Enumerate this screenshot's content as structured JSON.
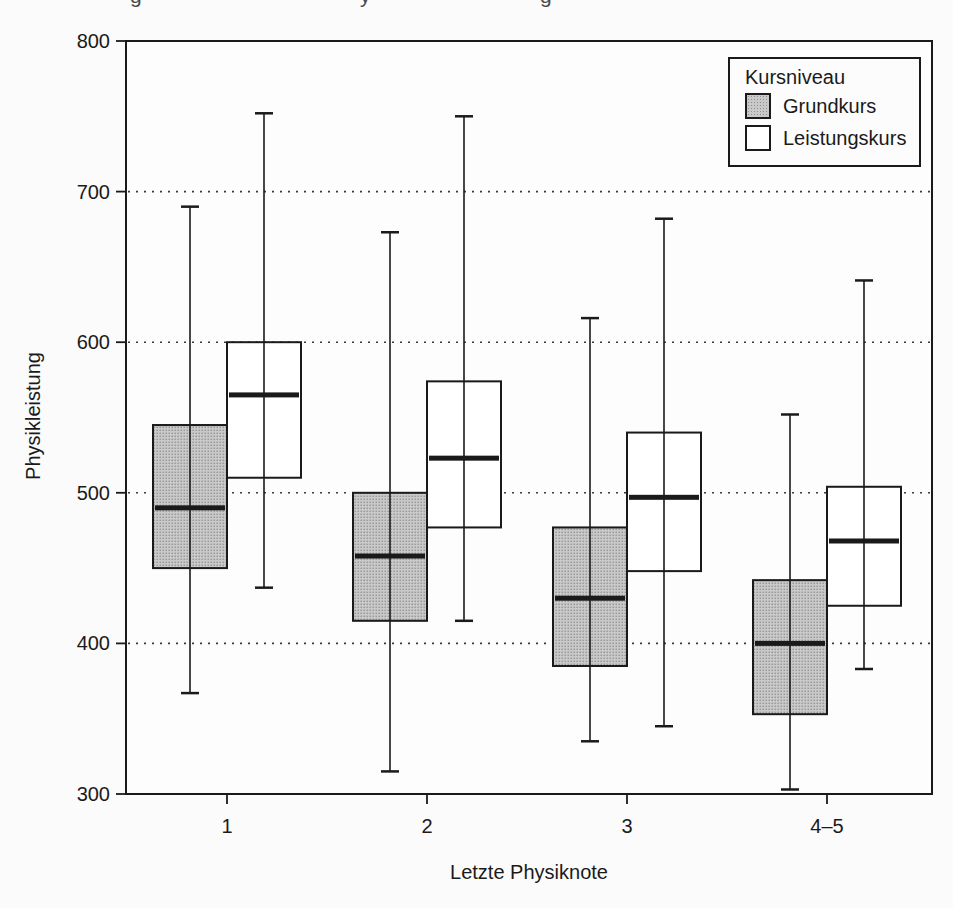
{
  "page": {
    "cropped_caption_fragments": [
      "g",
      "y",
      "g"
    ]
  },
  "chart_data": {
    "type": "boxplot",
    "title": "",
    "xlabel": "Letzte Physiknote",
    "ylabel": "Physikleistung",
    "ylim": [
      300,
      800
    ],
    "yticks": [
      300,
      400,
      500,
      600,
      700,
      800
    ],
    "gridlines": [
      400,
      500,
      600,
      700
    ],
    "grid_style": "dotted",
    "categories": [
      "1",
      "2",
      "3",
      "4–5"
    ],
    "legend": {
      "title": "Kursniveau",
      "position": "top-right",
      "entries": [
        {
          "label": "Grundkurs",
          "fill": "stippled-gray"
        },
        {
          "label": "Leistungskurs",
          "fill": "white"
        }
      ]
    },
    "series": [
      {
        "name": "Grundkurs",
        "style": "stippled-gray",
        "boxes": [
          {
            "category": "1",
            "whisker_low": 367,
            "q1": 450,
            "median": 490,
            "q3": 545,
            "whisker_high": 690
          },
          {
            "category": "2",
            "whisker_low": 315,
            "q1": 415,
            "median": 458,
            "q3": 500,
            "whisker_high": 673
          },
          {
            "category": "3",
            "whisker_low": 335,
            "q1": 385,
            "median": 430,
            "q3": 477,
            "whisker_high": 616
          },
          {
            "category": "4–5",
            "whisker_low": 303,
            "q1": 353,
            "median": 400,
            "q3": 442,
            "whisker_high": 552
          }
        ]
      },
      {
        "name": "Leistungskurs",
        "style": "white",
        "boxes": [
          {
            "category": "1",
            "whisker_low": 437,
            "q1": 510,
            "median": 565,
            "q3": 600,
            "whisker_high": 752
          },
          {
            "category": "2",
            "whisker_low": 415,
            "q1": 477,
            "median": 523,
            "q3": 574,
            "whisker_high": 750
          },
          {
            "category": "3",
            "whisker_low": 345,
            "q1": 448,
            "median": 497,
            "q3": 540,
            "whisker_high": 682
          },
          {
            "category": "4–5",
            "whisker_low": 383,
            "q1": 425,
            "median": 468,
            "q3": 504,
            "whisker_high": 641
          }
        ]
      }
    ],
    "colors": {
      "ink": "#1a1a1a",
      "grid": "#3a3a3a",
      "box_gray_base": "#c9c9c9",
      "box_gray_dot": "#8e8e8e",
      "box_white": "#ffffff",
      "page_background": "#fbfbfb",
      "plot_background": "#fdfdfd"
    }
  }
}
